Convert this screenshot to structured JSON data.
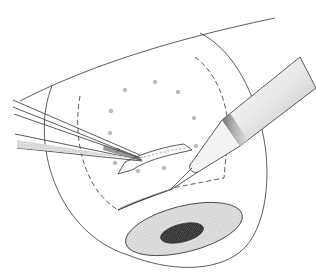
{
  "figure": {
    "type": "surgical line illustration",
    "text_labels": [],
    "colors": {
      "background": "#ffffff",
      "line": "#333333",
      "stipple": "#9a9a9a",
      "pupil": "#444444"
    },
    "elements": [
      {
        "name": "eyelid-contour"
      },
      {
        "name": "globe-outline"
      },
      {
        "name": "dashed-incision-outline"
      },
      {
        "name": "diathermy-marks",
        "count": 11
      },
      {
        "name": "scleral-flap"
      },
      {
        "name": "forceps"
      },
      {
        "name": "blade-handle"
      },
      {
        "name": "cornea"
      },
      {
        "name": "pupil"
      }
    ]
  }
}
